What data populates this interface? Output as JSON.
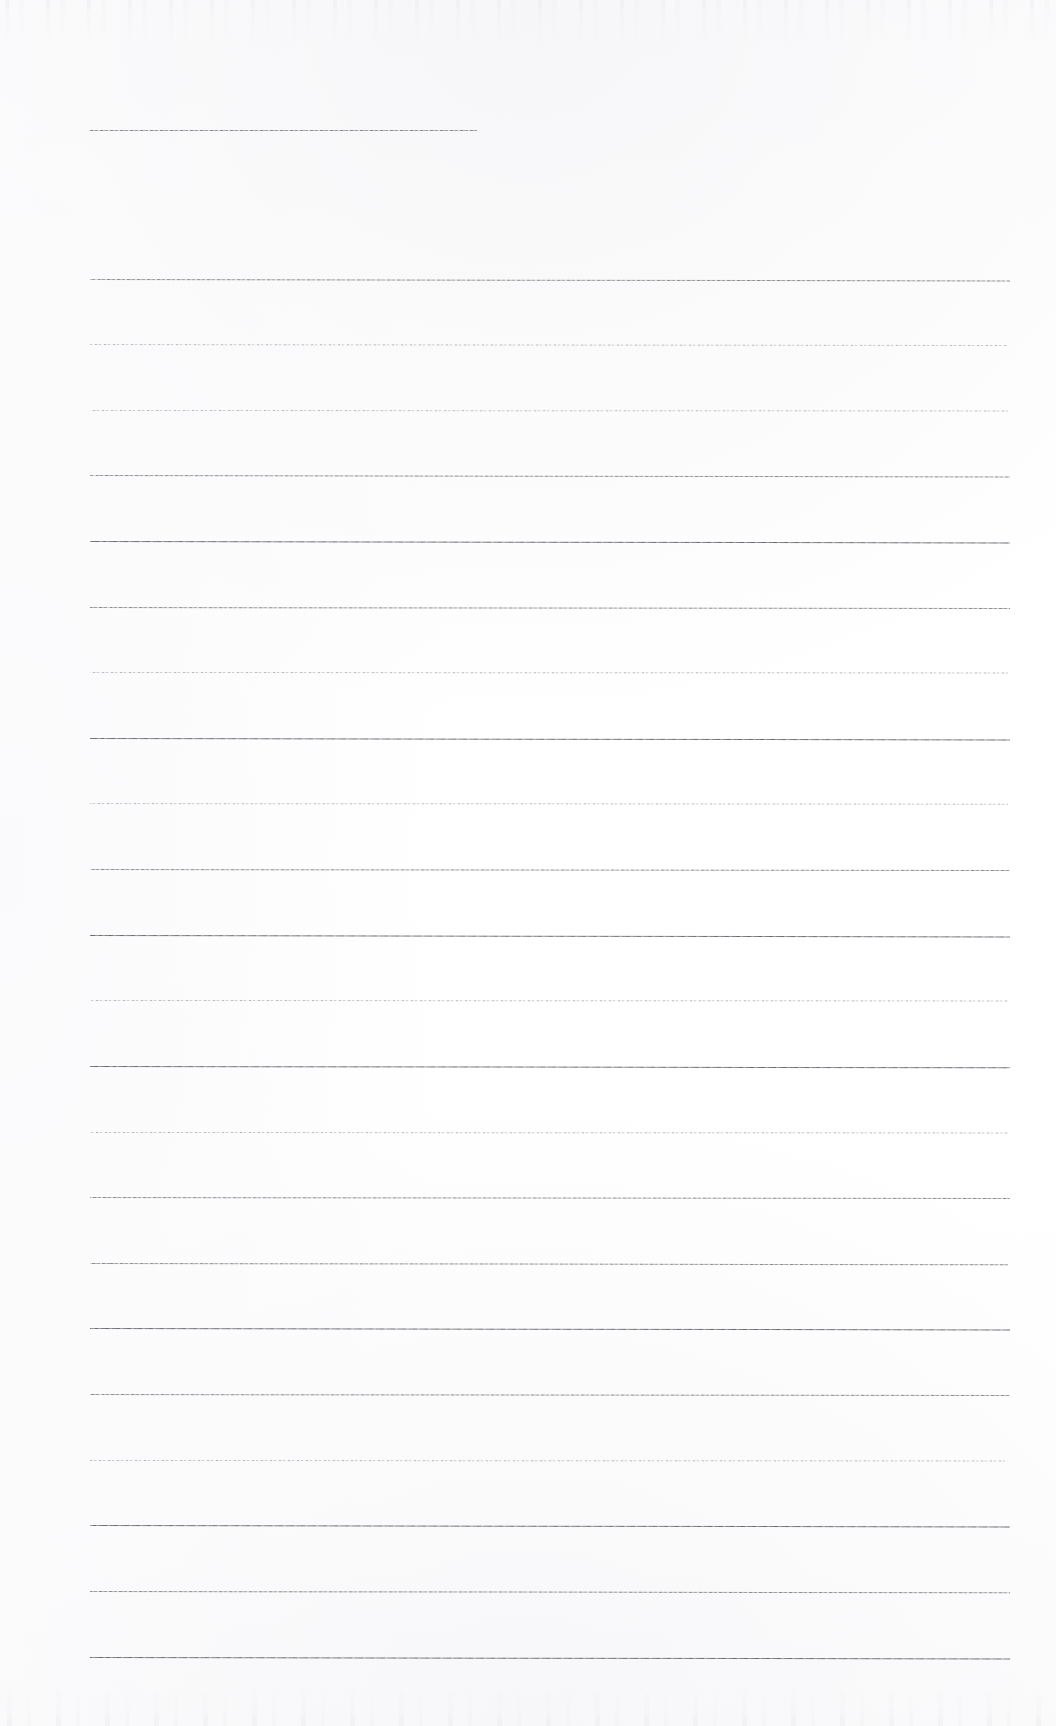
{
  "document": {
    "type": "scanned-ruled-paper",
    "title": "Blank lined notebook page",
    "description": "A scanned blank sheet of ruled writing paper with no handwriting or printed text.",
    "page_width": 1056,
    "page_height": 1726,
    "background_color": "#fdfdfd",
    "rule_color": "#8e8e96",
    "content_text": "",
    "has_text": false,
    "has_handwriting": false
  },
  "layout": {
    "left_margin_x": 90,
    "right_margin_x": 1010,
    "first_rule_y": 130,
    "rule_pitch": 65.5,
    "total_rules": 26,
    "full_width_rules": 25,
    "short_rules": 1
  },
  "rules": [
    {
      "id": "rule-1",
      "y": 130,
      "x1": 90,
      "x2": 477,
      "weight": "normal",
      "skew": 0.0,
      "note": "short header line"
    },
    {
      "id": "rule-2",
      "y": 279,
      "x1": 90,
      "x2": 1010,
      "weight": "normal",
      "skew": -1.5,
      "note": ""
    },
    {
      "id": "rule-3",
      "y": 344,
      "x1": 90,
      "x2": 1008,
      "weight": "dotted",
      "skew": -1.0,
      "note": ""
    },
    {
      "id": "rule-4",
      "y": 410,
      "x1": 90,
      "x2": 1008,
      "weight": "dotted",
      "skew": -0.5,
      "note": ""
    },
    {
      "id": "rule-5",
      "y": 475,
      "x1": 90,
      "x2": 1010,
      "weight": "normal",
      "skew": -1.5,
      "note": ""
    },
    {
      "id": "rule-6",
      "y": 541,
      "x1": 90,
      "x2": 1010,
      "weight": "strong",
      "skew": -1.5,
      "note": ""
    },
    {
      "id": "rule-7",
      "y": 607,
      "x1": 90,
      "x2": 1010,
      "weight": "normal",
      "skew": -1.0,
      "note": ""
    },
    {
      "id": "rule-8",
      "y": 672,
      "x1": 90,
      "x2": 1008,
      "weight": "dotted",
      "skew": -0.5,
      "note": ""
    },
    {
      "id": "rule-9",
      "y": 738,
      "x1": 90,
      "x2": 1010,
      "weight": "strong",
      "skew": -1.5,
      "note": ""
    },
    {
      "id": "rule-10",
      "y": 803,
      "x1": 90,
      "x2": 1008,
      "weight": "dotted",
      "skew": -0.8,
      "note": ""
    },
    {
      "id": "rule-11",
      "y": 869,
      "x1": 90,
      "x2": 1010,
      "weight": "normal",
      "skew": -1.0,
      "note": ""
    },
    {
      "id": "rule-12",
      "y": 935,
      "x1": 90,
      "x2": 1010,
      "weight": "strong",
      "skew": -1.5,
      "note": ""
    },
    {
      "id": "rule-13",
      "y": 1000,
      "x1": 90,
      "x2": 1008,
      "weight": "dotted",
      "skew": -0.5,
      "note": ""
    },
    {
      "id": "rule-14",
      "y": 1066,
      "x1": 90,
      "x2": 1010,
      "weight": "strong",
      "skew": -1.2,
      "note": ""
    },
    {
      "id": "rule-15",
      "y": 1132,
      "x1": 90,
      "x2": 1008,
      "weight": "dotted",
      "skew": -0.5,
      "note": ""
    },
    {
      "id": "rule-16",
      "y": 1197,
      "x1": 90,
      "x2": 1010,
      "weight": "normal",
      "skew": -1.0,
      "note": ""
    },
    {
      "id": "rule-17",
      "y": 1263,
      "x1": 90,
      "x2": 1008,
      "weight": "normal",
      "skew": -1.2,
      "note": ""
    },
    {
      "id": "rule-18",
      "y": 1328,
      "x1": 90,
      "x2": 1010,
      "weight": "strong",
      "skew": -1.5,
      "note": ""
    },
    {
      "id": "rule-19",
      "y": 1394,
      "x1": 90,
      "x2": 1010,
      "weight": "normal",
      "skew": -1.0,
      "note": ""
    },
    {
      "id": "rule-20",
      "y": 1460,
      "x1": 90,
      "x2": 1008,
      "weight": "dotted",
      "skew": -0.5,
      "note": ""
    },
    {
      "id": "rule-21",
      "y": 1525,
      "x1": 90,
      "x2": 1010,
      "weight": "strong",
      "skew": -1.5,
      "note": ""
    },
    {
      "id": "rule-22",
      "y": 1591,
      "x1": 90,
      "x2": 1010,
      "weight": "normal",
      "skew": -1.2,
      "note": ""
    },
    {
      "id": "rule-23",
      "y": 1657,
      "x1": 90,
      "x2": 1010,
      "weight": "strong",
      "skew": -1.5,
      "note": ""
    }
  ],
  "artifacts": {
    "top_noise_band": "faint speckled scanner noise along the upper edge",
    "bottom_noise_band": "faint speckled scanner noise along the lower edge",
    "left_edge_smudges": "very light gray smudges near the left border"
  }
}
